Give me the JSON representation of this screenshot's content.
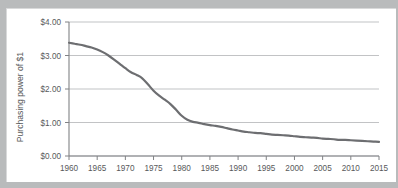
{
  "chart_data": {
    "type": "line",
    "title": "",
    "xlabel": "",
    "ylabel": "Purchasing power of $1",
    "xlim": [
      1960,
      2015
    ],
    "ylim": [
      0,
      4
    ],
    "grid": true,
    "legend": "none",
    "y_tick_labels": [
      "$0.00",
      "$1.00",
      "$2.00",
      "$3.00",
      "$4.00"
    ],
    "y_tick_values": [
      0,
      1,
      2,
      3,
      4
    ],
    "x_tick_labels": [
      "1960",
      "1965",
      "1970",
      "1975",
      "1980",
      "1985",
      "1990",
      "1995",
      "2000",
      "2005",
      "2010",
      "2015"
    ],
    "x_tick_values": [
      1960,
      1965,
      1970,
      1975,
      1980,
      1985,
      1990,
      1995,
      2000,
      2005,
      2010,
      2015
    ],
    "series": [
      {
        "name": "Purchasing power of $1",
        "color": "#6d6e71",
        "x": [
          1960,
          1961,
          1962,
          1963,
          1964,
          1965,
          1966,
          1967,
          1968,
          1969,
          1970,
          1971,
          1972,
          1973,
          1974,
          1975,
          1976,
          1977,
          1978,
          1979,
          1980,
          1981,
          1982,
          1983,
          1984,
          1985,
          1986,
          1987,
          1988,
          1989,
          1990,
          1991,
          1992,
          1993,
          1994,
          1995,
          1996,
          1997,
          1998,
          1999,
          2000,
          2001,
          2002,
          2003,
          2004,
          2005,
          2006,
          2007,
          2008,
          2009,
          2010,
          2011,
          2012,
          2013,
          2014,
          2015
        ],
        "y": [
          3.38,
          3.35,
          3.32,
          3.28,
          3.24,
          3.18,
          3.1,
          3.0,
          2.88,
          2.75,
          2.62,
          2.5,
          2.42,
          2.32,
          2.14,
          1.95,
          1.8,
          1.68,
          1.55,
          1.38,
          1.2,
          1.08,
          1.02,
          0.99,
          0.95,
          0.92,
          0.9,
          0.87,
          0.83,
          0.79,
          0.76,
          0.73,
          0.71,
          0.69,
          0.68,
          0.66,
          0.64,
          0.63,
          0.62,
          0.61,
          0.59,
          0.57,
          0.56,
          0.55,
          0.54,
          0.52,
          0.51,
          0.5,
          0.48,
          0.48,
          0.47,
          0.46,
          0.45,
          0.44,
          0.43,
          0.42
        ]
      }
    ],
    "colors": {
      "line": "#6d6e71",
      "gridline": "#a7a9ac",
      "axis": "#808285",
      "text": "#58595b",
      "panel_background": "#ffffff",
      "frame_background": "#b9bbbc"
    }
  }
}
